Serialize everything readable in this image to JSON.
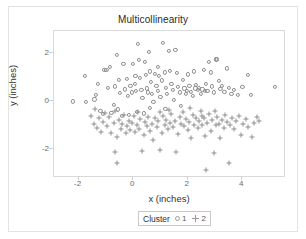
{
  "chart_data": {
    "type": "scatter",
    "title": "Multicollinearity",
    "xlabel": "x (inches)",
    "ylabel": "y (inches)",
    "xlim": [
      -2.9,
      5.6
    ],
    "ylim": [
      -3.2,
      2.9
    ],
    "xticks": [
      -2,
      0,
      2,
      4
    ],
    "xticklabels": [
      "-2",
      "0",
      "2",
      "4"
    ],
    "yticks": [
      2,
      0,
      -2
    ],
    "yticklabels": [
      "2",
      "0",
      "-2"
    ],
    "grid": false,
    "legend": {
      "title": "Cluster",
      "position": "bottom",
      "entries": [
        {
          "label": "1",
          "marker": "circle",
          "color": "#8e8e8e"
        },
        {
          "label": "2",
          "marker": "plus",
          "color": "#8e8e8e"
        }
      ]
    },
    "series": [
      {
        "name": "1",
        "marker": "circle",
        "color": "#8e8e8e",
        "points": [
          [
            -1.78,
            1.02
          ],
          [
            -2.22,
            -0.02
          ],
          [
            -1.72,
            -0.03
          ],
          [
            -1.42,
            0.06
          ],
          [
            -1.3,
            0.72
          ],
          [
            -1.35,
            0.25
          ],
          [
            -1.2,
            -0.42
          ],
          [
            -1.12,
            -0.55
          ],
          [
            -1.05,
            1.28
          ],
          [
            -0.98,
            1.3
          ],
          [
            -0.92,
            0.55
          ],
          [
            -0.86,
            1.42
          ],
          [
            -0.8,
            -0.5
          ],
          [
            -0.72,
            -0.15
          ],
          [
            -0.66,
            0.6
          ],
          [
            -0.6,
            1.9
          ],
          [
            -0.55,
            -0.35
          ],
          [
            -0.48,
            0.32
          ],
          [
            -0.42,
            -0.62
          ],
          [
            -0.36,
            1.55
          ],
          [
            -0.3,
            0.48
          ],
          [
            -0.24,
            0.9
          ],
          [
            -0.2,
            0.2
          ],
          [
            -0.15,
            -0.58
          ],
          [
            -0.1,
            0.62
          ],
          [
            -0.05,
            0.35
          ],
          [
            0.0,
            1.52
          ],
          [
            0.05,
            0.7
          ],
          [
            0.1,
            0.42
          ],
          [
            0.14,
            -0.45
          ],
          [
            0.18,
            2.35
          ],
          [
            0.22,
            1.7
          ],
          [
            0.26,
            0.95
          ],
          [
            0.3,
            0.45
          ],
          [
            0.34,
            0.12
          ],
          [
            0.38,
            -0.52
          ],
          [
            0.42,
            1.62
          ],
          [
            0.46,
            1.08
          ],
          [
            0.5,
            0.52
          ],
          [
            0.54,
            0.35
          ],
          [
            0.58,
            2.02
          ],
          [
            0.62,
            1.22
          ],
          [
            0.66,
            0.78
          ],
          [
            0.7,
            0.3
          ],
          [
            0.74,
            -0.05
          ],
          [
            0.8,
            1.12
          ],
          [
            0.85,
            0.62
          ],
          [
            0.9,
            0.4
          ],
          [
            0.95,
            1.05
          ],
          [
            1.0,
            0.18
          ],
          [
            1.05,
            0.85
          ],
          [
            1.1,
            2.42
          ],
          [
            1.15,
            1.18
          ],
          [
            1.2,
            0.55
          ],
          [
            1.25,
            0.3
          ],
          [
            1.3,
            2.08
          ],
          [
            1.35,
            1.25
          ],
          [
            1.4,
            0.72
          ],
          [
            1.45,
            0.45
          ],
          [
            1.5,
            0.05
          ],
          [
            1.55,
            2.12
          ],
          [
            1.6,
            1.15
          ],
          [
            1.65,
            0.58
          ],
          [
            1.7,
            0.35
          ],
          [
            1.75,
            -0.2
          ],
          [
            1.82,
            0.88
          ],
          [
            1.88,
            0.52
          ],
          [
            1.94,
            0.28
          ],
          [
            2.0,
            1.1
          ],
          [
            2.06,
            0.62
          ],
          [
            2.12,
            0.38
          ],
          [
            2.18,
            0.22
          ],
          [
            2.24,
            1.22
          ],
          [
            2.3,
            0.68
          ],
          [
            2.36,
            0.45
          ],
          [
            2.42,
            0.55
          ],
          [
            2.48,
            0.3
          ],
          [
            2.54,
            0.48
          ],
          [
            2.6,
            1.28
          ],
          [
            2.66,
            0.72
          ],
          [
            2.72,
            0.4
          ],
          [
            2.78,
            1.62
          ],
          [
            2.84,
            1.18
          ],
          [
            2.9,
            0.6
          ],
          [
            2.96,
            0.35
          ],
          [
            3.02,
            1.72
          ],
          [
            3.08,
            1.72
          ],
          [
            3.14,
            0.82
          ],
          [
            3.2,
            0.5
          ],
          [
            3.26,
            0.62
          ],
          [
            3.34,
            0.38
          ],
          [
            3.42,
            1.35
          ],
          [
            3.5,
            0.55
          ],
          [
            3.6,
            0.3
          ],
          [
            3.7,
            0.45
          ],
          [
            3.85,
            0.25
          ],
          [
            4.0,
            0.58
          ],
          [
            4.2,
            1.08
          ],
          [
            4.32,
            0.25
          ],
          [
            5.2,
            0.58
          ],
          [
            -0.52,
            0.88
          ],
          [
            0.08,
            1.02
          ],
          [
            0.92,
            1.42
          ],
          [
            1.98,
            0.42
          ],
          [
            2.28,
            0.52
          ],
          [
            2.62,
            0.42
          ],
          [
            0.6,
            -0.28
          ],
          [
            1.18,
            -0.32
          ]
        ]
      },
      {
        "name": "2",
        "marker": "plus",
        "color": "#8e8e8e",
        "points": [
          [
            -1.55,
            -0.62
          ],
          [
            -1.45,
            -0.95
          ],
          [
            -1.32,
            -1.12
          ],
          [
            -1.25,
            -0.72
          ],
          [
            -1.18,
            -1.28
          ],
          [
            -1.1,
            -0.88
          ],
          [
            -1.02,
            -0.5
          ],
          [
            -0.95,
            -1.05
          ],
          [
            -0.88,
            -0.68
          ],
          [
            -0.8,
            -1.32
          ],
          [
            -0.72,
            -0.92
          ],
          [
            -0.66,
            -2.12
          ],
          [
            -0.6,
            -1.48
          ],
          [
            -0.58,
            -2.58
          ],
          [
            -0.52,
            -0.78
          ],
          [
            -0.46,
            -1.18
          ],
          [
            -0.4,
            -0.95
          ],
          [
            -0.34,
            -0.6
          ],
          [
            -0.28,
            -1.35
          ],
          [
            -0.22,
            -1.05
          ],
          [
            -0.16,
            -0.82
          ],
          [
            -0.1,
            -1.22
          ],
          [
            -0.04,
            -0.9
          ],
          [
            0.02,
            -0.62
          ],
          [
            0.08,
            -1.28
          ],
          [
            0.14,
            -0.98
          ],
          [
            0.2,
            -1.15
          ],
          [
            0.26,
            -0.75
          ],
          [
            0.32,
            -2.08
          ],
          [
            0.38,
            -1.42
          ],
          [
            0.44,
            -0.88
          ],
          [
            0.5,
            -1.05
          ],
          [
            0.56,
            -0.65
          ],
          [
            0.62,
            -1.25
          ],
          [
            0.68,
            -0.95
          ],
          [
            0.74,
            -1.62
          ],
          [
            0.8,
            -0.72
          ],
          [
            0.86,
            -1.08
          ],
          [
            0.92,
            -0.85
          ],
          [
            0.98,
            -2.02
          ],
          [
            1.04,
            -1.32
          ],
          [
            1.1,
            -0.62
          ],
          [
            1.16,
            -1.0
          ],
          [
            1.22,
            -0.78
          ],
          [
            1.28,
            -1.18
          ],
          [
            1.34,
            -0.9
          ],
          [
            1.4,
            -0.55
          ],
          [
            1.46,
            -1.1
          ],
          [
            1.52,
            -0.82
          ],
          [
            1.58,
            -2.12
          ],
          [
            1.64,
            -1.38
          ],
          [
            1.7,
            -0.68
          ],
          [
            1.76,
            -0.95
          ],
          [
            1.82,
            -0.45
          ],
          [
            1.88,
            -1.05
          ],
          [
            1.94,
            -0.75
          ],
          [
            2.0,
            -1.22
          ],
          [
            2.06,
            -0.88
          ],
          [
            2.12,
            -1.55
          ],
          [
            2.18,
            -0.6
          ],
          [
            2.24,
            -0.98
          ],
          [
            2.3,
            -0.7
          ],
          [
            2.36,
            -1.12
          ],
          [
            2.42,
            -0.85
          ],
          [
            2.48,
            -0.42
          ],
          [
            2.54,
            -1.02
          ],
          [
            2.6,
            -0.72
          ],
          [
            2.64,
            -1.45
          ],
          [
            2.66,
            -2.88
          ],
          [
            2.72,
            -0.92
          ],
          [
            2.78,
            -0.55
          ],
          [
            2.84,
            -1.25
          ],
          [
            2.9,
            -0.8
          ],
          [
            2.96,
            -2.18
          ],
          [
            3.02,
            -1.02
          ],
          [
            3.08,
            -0.65
          ],
          [
            3.14,
            -0.95
          ],
          [
            3.2,
            -1.52
          ],
          [
            3.26,
            -0.78
          ],
          [
            3.32,
            -1.12
          ],
          [
            3.38,
            -0.58
          ],
          [
            3.44,
            -0.88
          ],
          [
            3.5,
            -2.58
          ],
          [
            3.56,
            -1.0
          ],
          [
            3.62,
            -0.72
          ],
          [
            3.7,
            -1.15
          ],
          [
            3.78,
            -0.85
          ],
          [
            3.86,
            -0.62
          ],
          [
            3.94,
            -1.42
          ],
          [
            4.02,
            -0.95
          ],
          [
            4.12,
            -0.75
          ],
          [
            4.22,
            -1.1
          ],
          [
            4.34,
            -1.48
          ],
          [
            4.42,
            -0.92
          ],
          [
            4.52,
            -0.68
          ],
          [
            4.62,
            -0.82
          ],
          [
            -1.38,
            -0.35
          ],
          [
            -0.68,
            -0.42
          ],
          [
            0.16,
            -0.45
          ],
          [
            1.0,
            -0.48
          ],
          [
            2.1,
            -0.3
          ],
          [
            2.52,
            -0.62
          ],
          [
            3.0,
            -0.4
          ],
          [
            1.3,
            -0.38
          ]
        ]
      }
    ]
  }
}
